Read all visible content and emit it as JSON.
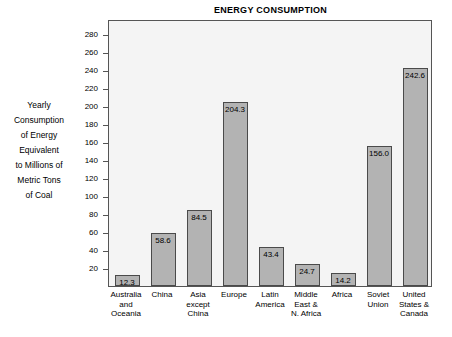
{
  "chart_data": {
    "type": "bar",
    "title": "ENERGY CONSUMPTION",
    "xlabel": "",
    "ylabel": "Yearly Consumption of Energy Equivalent to Millions of Metric Tons of Coal",
    "ylabel_lines": [
      "Yearly",
      "Consumption",
      "of Energy",
      "Equivalent",
      "to Millions of",
      "Metric Tons",
      "of Coal"
    ],
    "categories": [
      "Australia and Oceania",
      "China",
      "Asia except China",
      "Europe",
      "Latin America",
      "Middle East & N. Africa",
      "Africa",
      "Soviet Union",
      "United States & Canada"
    ],
    "category_lines": [
      [
        "Australia",
        "and",
        "Oceania"
      ],
      [
        "China"
      ],
      [
        "Asia",
        "except",
        "China"
      ],
      [
        "Europe"
      ],
      [
        "Latin",
        "America"
      ],
      [
        "Middle",
        "East &",
        "N. Africa"
      ],
      [
        "Africa"
      ],
      [
        "Soviet",
        "Union"
      ],
      [
        "United",
        "States &",
        "Canada"
      ]
    ],
    "values": [
      12.3,
      58.6,
      84.5,
      204.3,
      43.4,
      24.7,
      14.2,
      156.0,
      242.6
    ],
    "value_labels": [
      "12.3",
      "58.6",
      "84.5",
      "204.3",
      "43.4",
      "24.7",
      "14.2",
      "156.0",
      "242.6"
    ],
    "yticks": [
      20,
      40,
      60,
      80,
      100,
      120,
      140,
      160,
      180,
      200,
      220,
      240,
      260,
      280
    ],
    "ytick_labels": [
      "20",
      "40",
      "60",
      "80",
      "100",
      "120",
      "140",
      "160",
      "180",
      "200",
      "220",
      "240",
      "260",
      "280"
    ],
    "ylim": [
      0,
      297
    ],
    "grid": false,
    "legend": null,
    "colors": {
      "bar_fill": "#b3b3b3",
      "bar_border": "#4a4a4a",
      "plot_background": "#f4f4f4",
      "plot_border": "#555555",
      "text": "#000000"
    }
  }
}
